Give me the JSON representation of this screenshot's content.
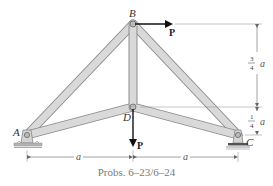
{
  "figure": {
    "caption": "Probs. 6–23/6–24",
    "joints": {
      "A": "A",
      "B": "B",
      "C": "C",
      "D": "D"
    },
    "loads": {
      "horizontal_at_B": "P",
      "vertical_at_D": "P"
    },
    "dimensions": {
      "left_span": "a",
      "right_span": "a",
      "upper_height_num": "3",
      "upper_height_den": "4",
      "upper_height_var": "a",
      "lower_height_num": "1",
      "lower_height_den": "4",
      "lower_height_var": "a"
    },
    "colors": {
      "member_fill": "#d9d9d9",
      "member_edge": "#8c8c8c",
      "arrow": "#111111",
      "dim_line": "#666666",
      "support": "#9a9a9a"
    }
  }
}
